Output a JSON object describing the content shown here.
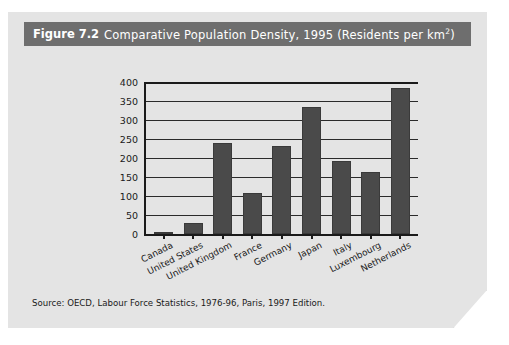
{
  "figure": {
    "number": "Figure 7.2",
    "title_main": "Comparative Population Density, 1995 (Residents per km",
    "title_sup": "2",
    "title_close": ")",
    "source": "Source: OECD, Labour Force Statistics, 1976-96, Paris, 1997 Edition."
  },
  "colors": {
    "band": "#6e6e6e",
    "page": "#e4e4e4",
    "bar": "#4a4a4a",
    "axis": "#1a1a1a"
  },
  "chart_data": {
    "type": "bar",
    "title": "Comparative Population Density, 1995 (Residents per km2)",
    "xlabel": "",
    "ylabel": "",
    "ylim": [
      0,
      400
    ],
    "yticks": [
      0,
      50,
      100,
      150,
      200,
      250,
      300,
      350,
      400
    ],
    "ytick_labels": [
      "0",
      "50",
      "100",
      "150",
      "200",
      "250",
      "300",
      "350",
      "400"
    ],
    "grid": true,
    "legend": "none",
    "categories": [
      "Canada",
      "United States",
      "United Kingdom",
      "France",
      "Germany",
      "Japan",
      "Italy",
      "Luxembourg",
      "Netherlands"
    ],
    "values": [
      3,
      28,
      240,
      107,
      232,
      335,
      191,
      163,
      383
    ],
    "units": "Residents per km2",
    "source": "OECD, Labour Force Statistics, 1976-96, Paris, 1997 Edition."
  }
}
